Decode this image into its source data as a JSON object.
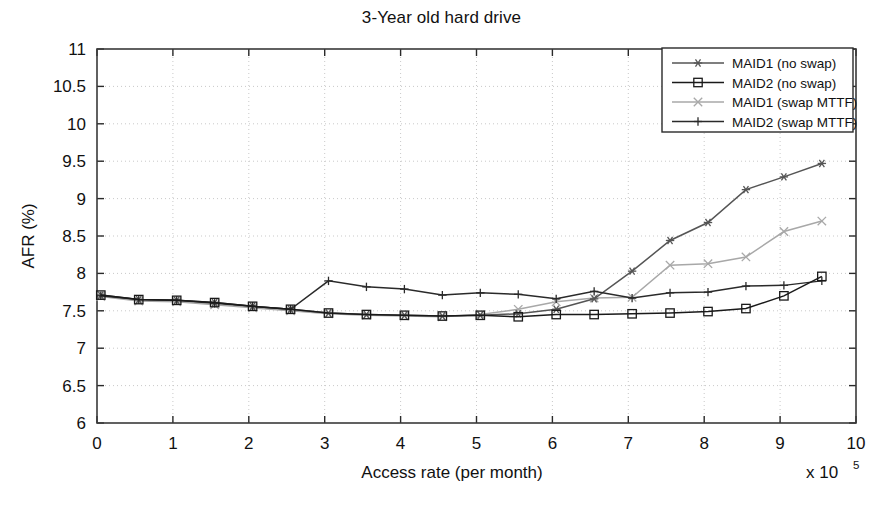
{
  "chart_data": {
    "type": "line",
    "title": "3-Year old hard drive",
    "xlabel": "Access rate (per month)",
    "ylabel": "AFR (%)",
    "x_multiplier": "x 10",
    "x_multiplier_exponent": "5",
    "xlim": [
      0,
      10
    ],
    "ylim": [
      6,
      11
    ],
    "xticks": [
      0,
      1,
      2,
      3,
      4,
      5,
      6,
      7,
      8,
      9,
      10
    ],
    "xtick_labels": [
      "0",
      "1",
      "2",
      "3",
      "4",
      "5",
      "6",
      "7",
      "8",
      "9",
      "10"
    ],
    "yticks": [
      6,
      6.5,
      7,
      7.5,
      8,
      8.5,
      9,
      9.5,
      10,
      10.5,
      11
    ],
    "ytick_labels": [
      "6",
      "6.5",
      "7",
      "7.5",
      "8",
      "8.5",
      "9",
      "9.5",
      "10",
      "10.5",
      "11"
    ],
    "grid": true,
    "grid_style": "dotted",
    "legend_position": "top-right",
    "x": [
      0.05,
      0.55,
      1.05,
      1.55,
      2.05,
      2.55,
      3.05,
      3.55,
      4.05,
      4.55,
      5.05,
      5.55,
      6.05,
      6.55,
      7.05,
      7.55,
      8.05,
      8.55,
      9.05,
      9.55
    ],
    "series": [
      {
        "name": "MAID1 (no swap)",
        "marker": "asterisk",
        "color": "#555555",
        "values": [
          7.71,
          7.65,
          7.64,
          7.61,
          7.56,
          7.52,
          7.47,
          7.45,
          7.44,
          7.43,
          7.44,
          7.46,
          7.52,
          7.66,
          8.03,
          8.44,
          8.68,
          9.12,
          9.29,
          9.47
        ]
      },
      {
        "name": "MAID2 (no swap)",
        "marker": "square",
        "color": "#1a1a1a",
        "values": [
          7.71,
          7.65,
          7.64,
          7.61,
          7.56,
          7.52,
          7.47,
          7.45,
          7.44,
          7.43,
          7.44,
          7.42,
          7.45,
          7.45,
          7.46,
          7.47,
          7.49,
          7.53,
          7.7,
          7.96
        ]
      },
      {
        "name": "MAID1 (swap MTTF)",
        "marker": "cross-x",
        "color": "#a8a8a8",
        "values": [
          7.69,
          7.63,
          7.62,
          7.58,
          7.54,
          7.5,
          7.46,
          7.44,
          7.43,
          7.42,
          7.45,
          7.52,
          7.62,
          7.67,
          7.68,
          8.11,
          8.13,
          8.22,
          8.56,
          8.7
        ]
      },
      {
        "name": "MAID2 (swap MTTF)",
        "marker": "plus",
        "color": "#2a2a2a",
        "values": [
          7.7,
          7.65,
          7.64,
          7.6,
          7.56,
          7.52,
          7.9,
          7.82,
          7.79,
          7.71,
          7.74,
          7.72,
          7.66,
          7.76,
          7.67,
          7.74,
          7.75,
          7.83,
          7.84,
          7.9
        ]
      }
    ]
  },
  "legend": {
    "items": [
      {
        "label": "MAID1 (no swap)"
      },
      {
        "label": "MAID2 (no swap)"
      },
      {
        "label": "MAID1 (swap MTTF)"
      },
      {
        "label": "MAID2 (swap MTTF)"
      }
    ]
  }
}
